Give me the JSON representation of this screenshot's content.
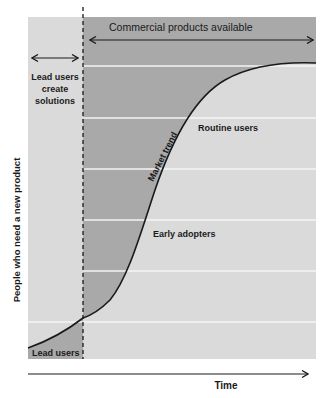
{
  "labels": {
    "commercial_products": "Commercial products available",
    "lead_users_create_line1": "Lead users",
    "lead_users_create_line2": "create",
    "lead_users_create_line3": "solutions",
    "market_trend": "Market trend",
    "routine_users": "Routine users",
    "early_adopters": "Early adopters",
    "lead_users": "Lead users",
    "y_axis": "People who need a new product",
    "x_axis": "Time"
  },
  "colors": {
    "dark_region": "#a9a9a9",
    "light_region": "#dadada",
    "grid_line": "#f4f4f4",
    "curve": "#1a1a1a",
    "text": "#1a1a1a"
  }
}
